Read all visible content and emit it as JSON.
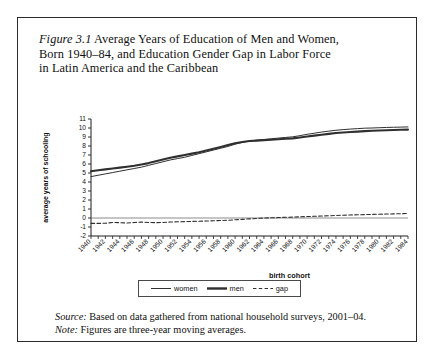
{
  "caption": {
    "figure_label": "Figure 3.1",
    "line1_rest": " Average Years of Education of Men and Women,",
    "line2": "Born 1940–84, and Education Gender Gap in Labor Force",
    "line3": "in Latin America and the Caribbean"
  },
  "notes": {
    "source_key": "Source:",
    "source_text": " Based on data gathered from national household surveys, 2001–04.",
    "note_key": "Note:",
    "note_text": " Figures are three-year moving averages."
  },
  "legend": {
    "items": [
      {
        "label": "women",
        "style": "solid-thin",
        "color": "#2f2f2f"
      },
      {
        "label": "men",
        "style": "solid-thick",
        "color": "#2f2f2f"
      },
      {
        "label": "gap",
        "style": "dashed",
        "color": "#2f2f2f"
      }
    ]
  },
  "chart_data": {
    "type": "line",
    "title": "Average Years of Education of Men and Women, Born 1940–84, and Education Gender Gap in Labor Force in Latin America and the Caribbean",
    "xlabel": "birth cohort",
    "ylabel": "average years of schooling",
    "xlim": [
      1940,
      1984
    ],
    "ylim": [
      -2,
      11
    ],
    "yticks": [
      -2,
      -1,
      0,
      1,
      2,
      3,
      4,
      5,
      6,
      7,
      8,
      9,
      10,
      11
    ],
    "xticks": [
      1940,
      1942,
      1944,
      1946,
      1948,
      1950,
      1952,
      1954,
      1956,
      1958,
      1960,
      1962,
      1964,
      1966,
      1968,
      1970,
      1972,
      1974,
      1976,
      1978,
      1980,
      1982,
      1984
    ],
    "xtick_minor_step": 1,
    "grid": false,
    "legend_position": "bottom-center",
    "zero_reference_line": 0,
    "x": [
      1940,
      1941,
      1942,
      1943,
      1944,
      1945,
      1946,
      1947,
      1948,
      1949,
      1950,
      1951,
      1952,
      1953,
      1954,
      1955,
      1956,
      1957,
      1958,
      1959,
      1960,
      1961,
      1962,
      1963,
      1964,
      1965,
      1966,
      1967,
      1968,
      1969,
      1970,
      1971,
      1972,
      1973,
      1974,
      1975,
      1976,
      1977,
      1978,
      1979,
      1980,
      1981,
      1982,
      1983,
      1984
    ],
    "series": [
      {
        "name": "men",
        "style": "solid-thick",
        "values": [
          5.2,
          5.3,
          5.4,
          5.5,
          5.6,
          5.7,
          5.8,
          5.95,
          6.1,
          6.3,
          6.5,
          6.7,
          6.85,
          7.0,
          7.15,
          7.3,
          7.5,
          7.7,
          7.9,
          8.1,
          8.3,
          8.45,
          8.55,
          8.6,
          8.65,
          8.7,
          8.75,
          8.8,
          8.85,
          8.95,
          9.05,
          9.15,
          9.25,
          9.35,
          9.45,
          9.5,
          9.55,
          9.6,
          9.65,
          9.7,
          9.72,
          9.75,
          9.78,
          9.8,
          9.82
        ]
      },
      {
        "name": "women",
        "style": "solid-thin",
        "values": [
          4.6,
          4.75,
          4.9,
          5.05,
          5.2,
          5.35,
          5.5,
          5.65,
          5.85,
          6.05,
          6.25,
          6.45,
          6.6,
          6.75,
          6.95,
          7.15,
          7.35,
          7.55,
          7.75,
          7.95,
          8.2,
          8.4,
          8.55,
          8.65,
          8.72,
          8.8,
          8.88,
          8.95,
          9.02,
          9.15,
          9.3,
          9.42,
          9.55,
          9.65,
          9.75,
          9.82,
          9.88,
          9.93,
          9.98,
          10.0,
          10.03,
          10.06,
          10.08,
          10.1,
          10.12
        ]
      },
      {
        "name": "gap",
        "style": "dashed",
        "values": [
          -0.6,
          -0.6,
          -0.58,
          -0.5,
          -0.52,
          -0.55,
          -0.5,
          -0.45,
          -0.5,
          -0.52,
          -0.5,
          -0.45,
          -0.42,
          -0.4,
          -0.38,
          -0.36,
          -0.34,
          -0.3,
          -0.28,
          -0.25,
          -0.2,
          -0.15,
          -0.1,
          -0.05,
          0.0,
          0.02,
          0.05,
          0.08,
          0.1,
          0.13,
          0.16,
          0.19,
          0.22,
          0.25,
          0.28,
          0.31,
          0.34,
          0.36,
          0.38,
          0.4,
          0.42,
          0.44,
          0.46,
          0.48,
          0.5
        ]
      }
    ]
  }
}
